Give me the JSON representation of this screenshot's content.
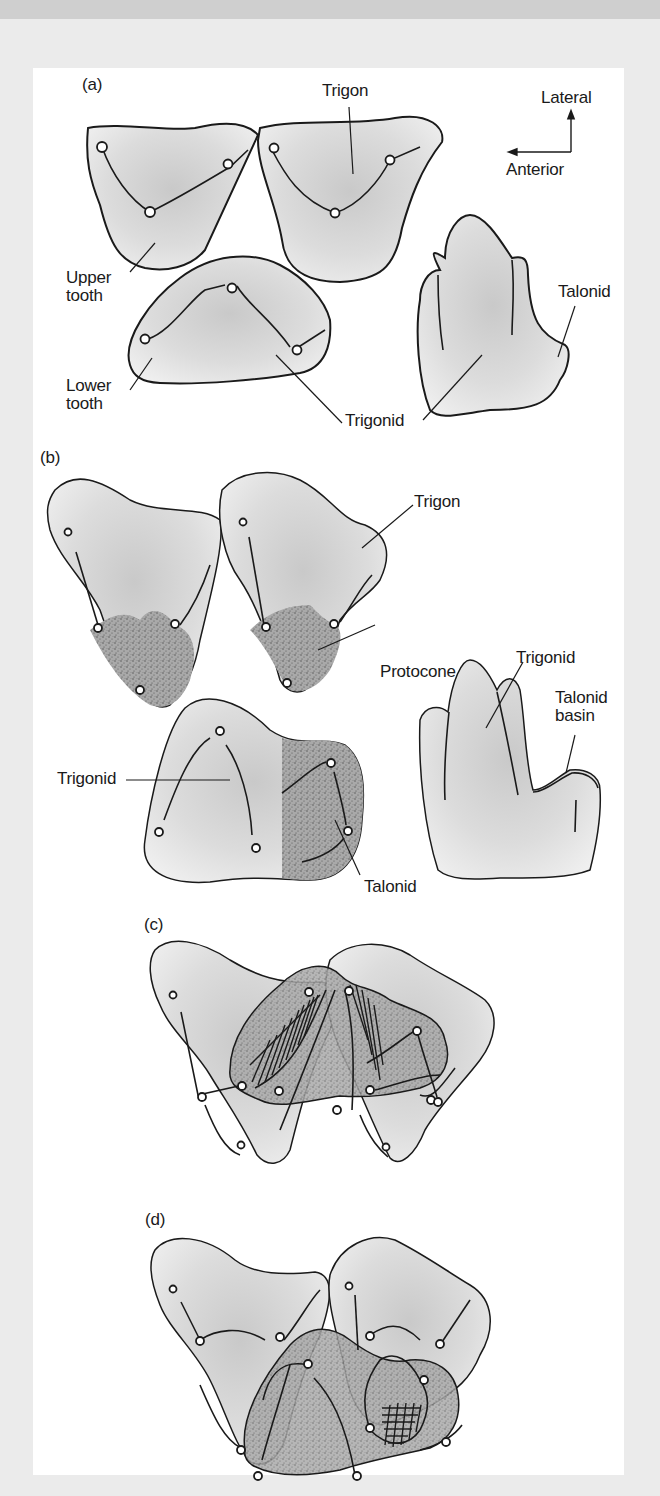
{
  "figure": {
    "background_color": "#ebebeb",
    "panel_color": "#ffffff",
    "top_band_color": "#cfcfcf",
    "tooth_fill": "#d6d6d6",
    "stipple_color": "#6e6e6e"
  },
  "panel_a": {
    "label": "(a)",
    "labels": {
      "trigon": "Trigon",
      "upper_tooth": "Upper\ntooth",
      "lower_tooth": "Lower\ntooth",
      "trigonid": "Trigonid",
      "talonid": "Talonid"
    },
    "orientation": {
      "lateral": "Lateral",
      "anterior": "Anterior"
    }
  },
  "panel_b": {
    "label": "(b)",
    "labels": {
      "trigon": "Trigon",
      "protocone": "Protocone",
      "trigonid_side": "Trigonid",
      "talonid_basin": "Talonid\nbasin",
      "trigonid_lower": "Trigonid",
      "talonid": "Talonid"
    }
  },
  "panel_c": {
    "label": "(c)"
  },
  "panel_d": {
    "label": "(d)"
  }
}
